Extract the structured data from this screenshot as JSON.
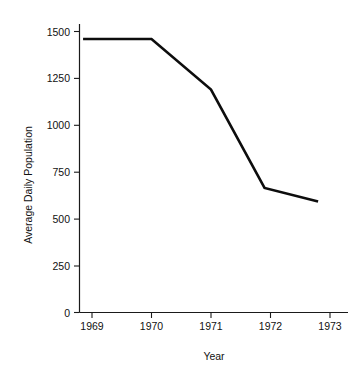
{
  "chart_data": {
    "type": "line",
    "title": "",
    "xlabel": "Year",
    "ylabel": "Average Daily Population",
    "xlim": [
      1968.85,
      1972.8
    ],
    "ylim": [
      0,
      1560
    ],
    "grid": false,
    "legend": null,
    "x_ticks": [
      1969,
      1970,
      1971,
      1972,
      1973
    ],
    "x_tick_labels": [
      "1969",
      "1970",
      "1971",
      "1972",
      "1973"
    ],
    "y_ticks": [
      0,
      250,
      500,
      750,
      1000,
      1250,
      1500
    ],
    "y_tick_labels": [
      "0",
      "250",
      "500",
      "750",
      "1000",
      "1250",
      "1500"
    ],
    "series": [
      {
        "name": "Average Daily Population",
        "color": "#0d0d0d",
        "x": [
          1968.85,
          1970.0,
          1971.0,
          1971.9,
          1972.8
        ],
        "values": [
          1460,
          1460,
          1190,
          665,
          592
        ]
      }
    ],
    "points": [
      {
        "year": 1968.85,
        "population": 1460
      },
      {
        "year": 1970.0,
        "population": 1460
      },
      {
        "year": 1971.0,
        "population": 1190
      },
      {
        "year": 1971.9,
        "population": 665
      },
      {
        "year": 1972.8,
        "population": 592
      }
    ]
  },
  "axes": {
    "y_title": "Average Daily Population",
    "x_title": "Year",
    "y_labels": [
      "1500",
      "1250",
      "1000",
      "750",
      "500",
      "250",
      "0"
    ],
    "x_labels": [
      "1969",
      "1970",
      "1971",
      "1972",
      "1973"
    ]
  }
}
